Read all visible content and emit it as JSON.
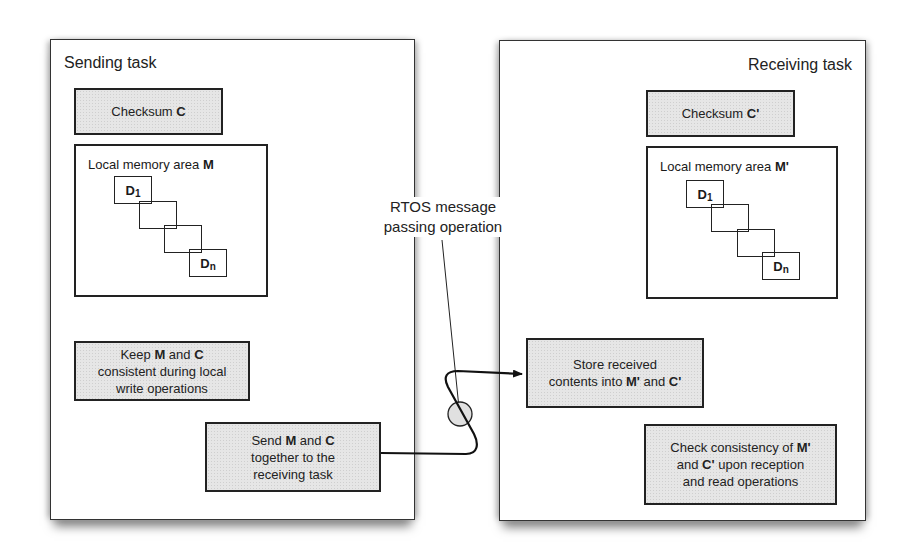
{
  "sending_task": {
    "title": "Sending task",
    "checksum": {
      "prefix": "Checksum ",
      "symbol": "C"
    },
    "memory": {
      "prefix": "Local memory area ",
      "symbol": "M",
      "first_block": "D",
      "first_sub": "1",
      "last_block": "D",
      "last_sub": "n"
    },
    "keep_box": {
      "l1a": "Keep ",
      "l1b": "M",
      "l1c": " and ",
      "l1d": "C",
      "l2": "consistent during local",
      "l3": "write operations"
    },
    "send_box": {
      "l1a": "Send ",
      "l1b": "M",
      "l1c": " and ",
      "l1d": "C",
      "l2": "together to the",
      "l3": "receiving task"
    }
  },
  "receiving_task": {
    "title": "Receiving task",
    "checksum": {
      "prefix": "Checksum ",
      "symbol": "C'"
    },
    "memory": {
      "prefix": "Local memory area ",
      "symbol": "M'",
      "first_block": "D",
      "first_sub": "1",
      "last_block": "D",
      "last_sub": "n"
    },
    "store_box": {
      "l1": "Store received",
      "l2a": "contents into ",
      "l2b": "M'",
      "l2c": " and ",
      "l2d": "C'"
    },
    "check_box": {
      "l1a": "Check consistency of  ",
      "l1b": "M'",
      "l2a": "and ",
      "l2b": "C'",
      "l2c": " upon reception",
      "l3": "and read operations"
    }
  },
  "connector": {
    "label_line1": "RTOS message",
    "label_line2": "passing operation"
  }
}
